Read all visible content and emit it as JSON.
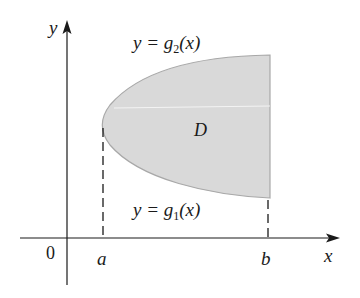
{
  "figure": {
    "region_label": "D",
    "upper_curve_label": "y = g₂(x)",
    "lower_curve_label": "y = g₁(x)",
    "upper_parts": {
      "pre": "y = g",
      "sub": "2",
      "post": "(x)"
    },
    "lower_parts": {
      "pre": "y = g",
      "sub": "1",
      "post": "(x)"
    },
    "x_axis_label": "x",
    "y_axis_label": "y",
    "origin_label": "0",
    "a_label": "a",
    "b_label": "b",
    "colors": {
      "region_fill": "#d9d9d9",
      "region_stroke": "#a8a8a8",
      "axis": "#1a1a1a"
    }
  }
}
